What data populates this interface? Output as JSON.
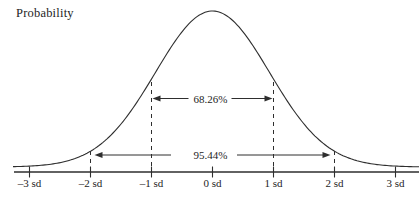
{
  "ylabel": "Probability",
  "chart_data": {
    "type": "line",
    "curve": "standard normal distribution bell curve",
    "title": "",
    "xlabel": "",
    "ylabel": "Probability",
    "y_axis_scale": "unlabeled",
    "grid": false,
    "legend": false,
    "x_range_sd": [
      -3.3,
      3.4
    ],
    "x_tick_values": [
      -3,
      -2,
      -1,
      0,
      1,
      2,
      3
    ],
    "x_tick_labels": [
      "–3 sd",
      "–2 sd",
      "–1 sd",
      "0 sd",
      "1 sd",
      "2 sd",
      "3 sd"
    ],
    "annotations": [
      {
        "label": "68.26%",
        "from_sd": -1,
        "to_sd": 1
      },
      {
        "label": "95.44%",
        "from_sd": -2,
        "to_sd": 2
      }
    ]
  },
  "colors": {
    "ink": "#2e2e2e",
    "text": "#1d1d1d",
    "background": "#ffffff"
  }
}
